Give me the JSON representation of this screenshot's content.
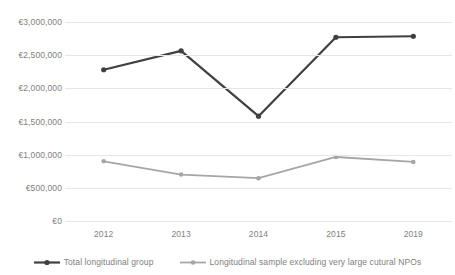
{
  "chart_data": {
    "type": "line",
    "title": "",
    "xlabel": "",
    "ylabel": "",
    "categories": [
      "2012",
      "2013",
      "2014",
      "2015",
      "2019"
    ],
    "ylim": [
      0,
      3000000
    ],
    "ytick_labels": [
      "€3,000,000",
      "€2,500,000",
      "€2,000,000",
      "€1,500,000",
      "€1,000,000",
      "€500,000",
      "€0"
    ],
    "ytick_values": [
      3000000,
      2500000,
      2000000,
      1500000,
      1000000,
      500000,
      0
    ],
    "grid": true,
    "legend_position": "bottom",
    "series": [
      {
        "name": "Total longitudinal group",
        "color": "#404040",
        "values": [
          2280000,
          2565000,
          1580000,
          2770000,
          2785000
        ]
      },
      {
        "name": "Longitudinal sample excluding very large cutural NPOs",
        "color": "#a6a6a6",
        "values": [
          900000,
          700000,
          645000,
          965000,
          890000
        ]
      }
    ]
  },
  "colors": {
    "gridline": "#e6e6e6",
    "axis_text": "#808080",
    "series_dark": "#404040",
    "series_gray": "#a6a6a6",
    "background": "#ffffff"
  }
}
